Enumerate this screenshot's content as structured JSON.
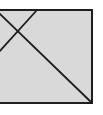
{
  "diagram": {
    "colors": {
      "fill": "#d9d9d9",
      "stroke": "#1e1e1e",
      "background": "#ffffff"
    },
    "shapes": [
      {
        "kind": "rectangle",
        "name": "box"
      },
      {
        "kind": "line",
        "name": "diagonal-long"
      },
      {
        "kind": "line",
        "name": "diagonal-short"
      }
    ]
  }
}
